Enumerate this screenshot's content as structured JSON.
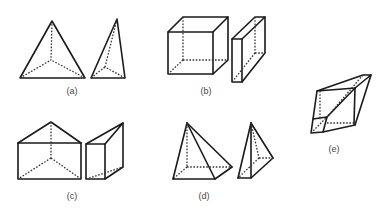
{
  "figure": {
    "labels": {
      "a": "(a)",
      "b": "(b)",
      "c": "(c)",
      "d": "(d)",
      "e": "(e)"
    },
    "groups": [
      {
        "id": "a",
        "shapes": [
          "regular tetrahedron",
          "tall tetrahedron"
        ]
      },
      {
        "id": "b",
        "shapes": [
          "cube",
          "thin rectangular slab"
        ]
      },
      {
        "id": "c",
        "shapes": [
          "triangular prism (front view)",
          "triangular prism (side view)"
        ]
      },
      {
        "id": "d",
        "shapes": [
          "square pyramid",
          "narrow square pyramid"
        ]
      },
      {
        "id": "e",
        "shapes": [
          "skewed composite parallelepiped"
        ]
      }
    ],
    "colors": {
      "line": "#1a1a1a",
      "background": "#ffffff"
    }
  }
}
